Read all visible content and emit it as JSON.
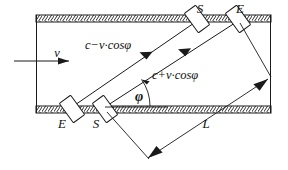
{
  "diagram": {
    "labels": {
      "transducer_top_left": "S",
      "transducer_top_right": "E",
      "transducer_bottom_left": "E",
      "transducer_bottom_right": "S",
      "velocity": "v",
      "beam_upstream": "c−v·cosφ",
      "beam_downstream": "c+v·cosφ",
      "angle": "φ",
      "path_length": "L"
    },
    "colors": {
      "line": "#1a1a1a",
      "background": "#ffffff",
      "wall_fill": "#ffffff"
    },
    "geometry": {
      "pipe_left_x": 36,
      "pipe_right_x": 271,
      "wall_top_y": 15,
      "wall_bottom_y": 106,
      "wall_thickness": 7,
      "angle_degrees": 36
    }
  }
}
